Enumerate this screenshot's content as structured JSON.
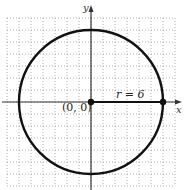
{
  "figure": {
    "type": "circle-on-grid",
    "axes": {
      "x_label": "x",
      "y_label": "y"
    },
    "grid": {
      "style": "dotted",
      "units_per_cell": 1,
      "x_range": [
        -7,
        7
      ],
      "y_range": [
        -7,
        7
      ]
    },
    "circle": {
      "center": [
        0,
        0
      ],
      "radius": 6
    },
    "points": [
      {
        "label": "(0, 0)",
        "x": 0,
        "y": 0
      },
      {
        "label": "",
        "x": 6,
        "y": 0
      }
    ],
    "annotations": {
      "center_label": "(0, 0)",
      "radius_label": "r = 6"
    },
    "colors": {
      "curve": "#111111",
      "axis": "#333333",
      "grid": "#9a9a9a",
      "background": "#ffffff"
    }
  }
}
